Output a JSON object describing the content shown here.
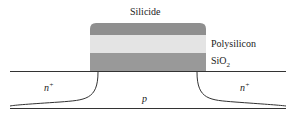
{
  "labels": {
    "silicide": "Silicide",
    "polysilicon": "Polysilicon",
    "sio2_main": "SiO",
    "sio2_sub": "2",
    "n_left": "n",
    "n_left_sup": "+",
    "n_right": "n",
    "n_right_sup": "+",
    "p_region": "p"
  },
  "colors": {
    "silicide": "#8f8f8f",
    "polysilicon": "#e4e4e4",
    "sio2": "#999999",
    "line": "#333333"
  }
}
